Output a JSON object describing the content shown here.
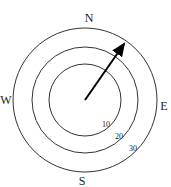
{
  "diagram": {
    "type": "compass-rose",
    "center": [
      85,
      100
    ],
    "directions": {
      "north": "N",
      "south": "S",
      "east": "E",
      "west": "W"
    },
    "rings": [
      {
        "label": "10",
        "radius": 36
      },
      {
        "label": "20",
        "radius": 53
      },
      {
        "label": "30",
        "radius": 72
      }
    ],
    "arrow": {
      "from": [
        85,
        100
      ],
      "to": [
        126,
        41
      ],
      "color": "#000000"
    }
  }
}
